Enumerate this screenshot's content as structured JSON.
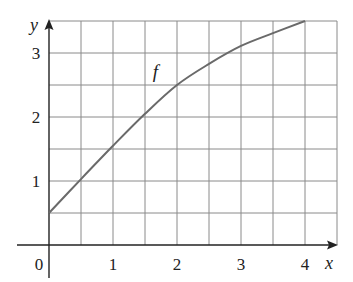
{
  "chart_data": {
    "type": "line",
    "title": "",
    "xlabel": "x",
    "ylabel": "y",
    "xlim": [
      0,
      4.5
    ],
    "ylim": [
      0,
      3.5
    ],
    "grid": true,
    "grid_step": 0.5,
    "legend": "none",
    "x_ticks": [
      0,
      1,
      2,
      3,
      4
    ],
    "x_tick_labels": [
      "0",
      "1",
      "2",
      "3",
      "4"
    ],
    "y_ticks": [
      1,
      2,
      3
    ],
    "y_tick_labels": [
      "1",
      "2",
      "3"
    ],
    "series": [
      {
        "name": "f",
        "x": [
          0,
          0.5,
          1,
          1.5,
          2,
          2.5,
          3,
          3.5,
          4
        ],
        "values": [
          0.5,
          1.03,
          1.55,
          2.05,
          2.5,
          2.83,
          3.11,
          3.31,
          3.5
        ]
      }
    ],
    "annotations": [
      {
        "text": "f",
        "x": 1.7,
        "y": 2.7
      }
    ]
  },
  "colors": {
    "grid": "#8a8a8a",
    "axis": "#222222",
    "curve": "#6a6a6a"
  }
}
